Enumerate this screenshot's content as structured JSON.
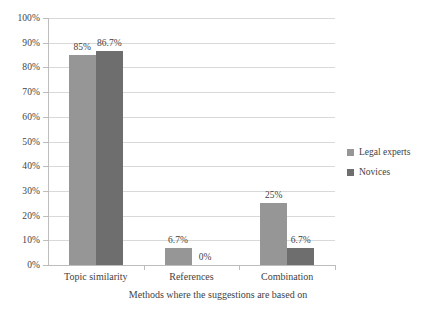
{
  "chart_data": {
    "type": "bar",
    "title": "",
    "xlabel": "Methods where the suggestions are based on",
    "ylabel": "",
    "ylim": [
      0,
      100
    ],
    "grid": true,
    "legend_position": "right",
    "categories": [
      "Topic similarity",
      "References",
      "Combination"
    ],
    "ytick_labels": [
      "100%",
      "90%",
      "80%",
      "70%",
      "60%",
      "50%",
      "40%",
      "30%",
      "20%",
      "10%",
      "0%"
    ],
    "ytick_values": [
      100,
      90,
      80,
      70,
      60,
      50,
      40,
      30,
      20,
      10,
      0
    ],
    "series": [
      {
        "name": "Legal experts",
        "color": "#969696",
        "values": [
          85,
          6.7,
          25
        ],
        "data_labels": [
          "85%",
          "6.7%",
          "25%"
        ]
      },
      {
        "name": "Novices",
        "color": "#6e6e6e",
        "values": [
          86.7,
          0,
          6.7
        ],
        "data_labels": [
          "86.7%",
          "0%",
          "6.7%"
        ]
      }
    ]
  },
  "legend": {
    "items": [
      {
        "label": "Legal experts",
        "color": "#969696"
      },
      {
        "label": "Novices",
        "color": "#6e6e6e"
      }
    ]
  },
  "axis": {
    "x_title": "Methods where the suggestions are based on"
  }
}
